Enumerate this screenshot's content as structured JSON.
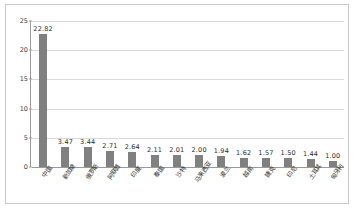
{
  "chart_data": {
    "type": "bar",
    "title": "",
    "xlabel": "",
    "ylabel": "",
    "ylim": [
      0,
      25
    ],
    "yticks": [
      0,
      5,
      10,
      15,
      20,
      25
    ],
    "grid": true,
    "legend": "none",
    "bar_color": "#808080",
    "categories": [
      "中国",
      "新加坡",
      "俄罗斯",
      "阿联酋",
      "印度",
      "泰国",
      "沙特",
      "马来西亚",
      "波兰",
      "越南",
      "捷克",
      "印尼",
      "土耳其",
      "匈牙利"
    ],
    "values": [
      22.82,
      3.47,
      3.44,
      2.71,
      2.64,
      2.11,
      2.01,
      2.0,
      1.94,
      1.62,
      1.57,
      1.5,
      1.44,
      1.0
    ],
    "value_labels": [
      "22.82",
      "3.47",
      "3.44",
      "2.71",
      "2.64",
      "2.11",
      "2.01",
      "2.00",
      "1.94",
      "1.62",
      "1.57",
      "1.50",
      "1.44",
      "1.00"
    ],
    "ytick_labels": [
      "0",
      "5",
      "10",
      "15",
      "20",
      "25"
    ]
  }
}
